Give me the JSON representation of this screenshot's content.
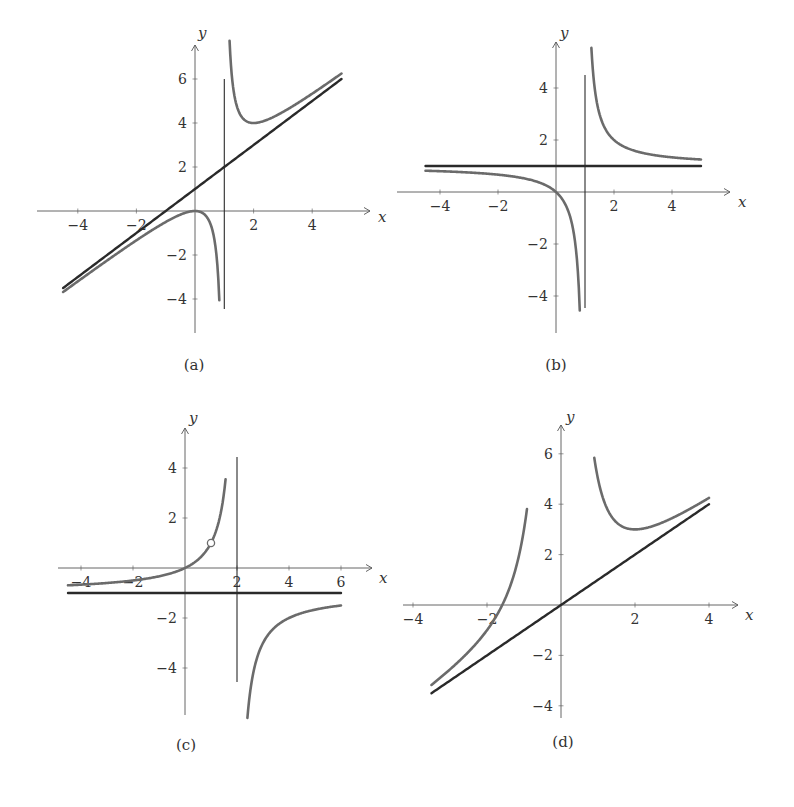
{
  "figure": {
    "captions": [
      "(a)",
      "(b)",
      "(c)",
      "(d)"
    ],
    "colors": {
      "curve": "#6b6b6b",
      "asymptote": "#2a2a2a",
      "axis": "#555555",
      "text": "#333333"
    }
  },
  "chart_data": [
    {
      "type": "line",
      "panel": "(a)",
      "title": "",
      "xlabel": "x",
      "ylabel": "y",
      "xticks": [
        -4,
        -2,
        2,
        4
      ],
      "yticks": [
        -4,
        -2,
        2,
        4,
        6
      ],
      "xlim": [
        -4.5,
        5
      ],
      "ylim": [
        -4.5,
        6
      ],
      "grid": false,
      "series": [
        {
          "name": "f(x) = x^2/(x-1)",
          "role": "curve",
          "formula": "x*x/(x-1)",
          "branches": [
            [
              -4.5,
              0.83
            ],
            [
              1.18,
              5
            ]
          ]
        },
        {
          "name": "y = x + 1",
          "role": "oblique-asymptote",
          "formula": "x+1",
          "branches": [
            [
              -4.5,
              5
            ]
          ]
        },
        {
          "name": "x = 1",
          "role": "vertical-asymptote",
          "x": 1,
          "yrange": [
            -4.5,
            6
          ]
        }
      ],
      "key_points": [
        {
          "x": 0,
          "y": 0,
          "label": "local max"
        },
        {
          "x": 2,
          "y": 4,
          "label": "local min"
        }
      ]
    },
    {
      "type": "line",
      "panel": "(b)",
      "title": "",
      "xlabel": "x",
      "ylabel": "y",
      "xticks": [
        -4,
        -2,
        2,
        4
      ],
      "yticks": [
        -4,
        -2,
        2,
        4
      ],
      "xlim": [
        -4.5,
        5
      ],
      "ylim": [
        -4.5,
        4.5
      ],
      "grid": false,
      "series": [
        {
          "name": "f(x) = x/(x-1)",
          "role": "curve",
          "formula": "x/(x-1)",
          "branches": [
            [
              -4.5,
              0.82
            ],
            [
              1.22,
              5
            ]
          ]
        },
        {
          "name": "y = 1",
          "role": "horizontal-asymptote",
          "formula": "1",
          "branches": [
            [
              -4.5,
              5
            ]
          ]
        },
        {
          "name": "x = 1",
          "role": "vertical-asymptote",
          "x": 1,
          "yrange": [
            -4.5,
            4.5
          ]
        }
      ],
      "key_points": [
        {
          "x": 0,
          "y": 0,
          "label": "intercept"
        }
      ]
    },
    {
      "type": "line",
      "panel": "(c)",
      "title": "",
      "xlabel": "x",
      "ylabel": "y",
      "xticks": [
        -4,
        -2,
        2,
        4,
        6
      ],
      "yticks": [
        -4,
        -2,
        2,
        4
      ],
      "xlim": [
        -4.5,
        6
      ],
      "ylim": [
        -5,
        4.5
      ],
      "grid": false,
      "series": [
        {
          "name": "f(x) = x/(2-x)",
          "role": "curve",
          "formula": "x/(2-x)",
          "branches": [
            [
              -4.5,
              1.56
            ],
            [
              2.4,
              6
            ]
          ]
        },
        {
          "name": "y = -1",
          "role": "horizontal-asymptote",
          "formula": "-1",
          "branches": [
            [
              -4.5,
              6
            ]
          ]
        },
        {
          "name": "x = 2",
          "role": "vertical-asymptote",
          "x": 2,
          "yrange": [
            -4.5,
            4.5
          ]
        }
      ],
      "key_points": [
        {
          "x": 1,
          "y": 1,
          "label": "hole (open circle)"
        },
        {
          "x": 0,
          "y": 0,
          "label": "intercept"
        }
      ]
    },
    {
      "type": "line",
      "panel": "(d)",
      "title": "",
      "xlabel": "x",
      "ylabel": "y",
      "xticks": [
        -4,
        -2,
        2,
        4
      ],
      "yticks": [
        -4,
        -2,
        2,
        4,
        6
      ],
      "xlim": [
        -3.5,
        4
      ],
      "ylim": [
        -4.5,
        6
      ],
      "grid": false,
      "series": [
        {
          "name": "f(x) = x + 4/x^2",
          "role": "curve",
          "formula": "x+4/(x*x)",
          "branches": [
            [
              -3.5,
              -0.92
            ],
            [
              0.9,
              4
            ]
          ]
        },
        {
          "name": "y = x",
          "role": "oblique-asymptote",
          "formula": "x",
          "branches": [
            [
              -3.5,
              4
            ]
          ]
        }
      ],
      "key_points": [
        {
          "x": 2,
          "y": 3,
          "label": "local min"
        },
        {
          "x": -1.59,
          "y": 0,
          "label": "root"
        }
      ]
    }
  ],
  "panels": [
    {
      "origin": [
        195,
        211
      ],
      "sx": 29.3,
      "sy": 22.0,
      "xaxis": [
        37,
        370
      ],
      "yaxis": [
        45,
        333
      ],
      "caption_pos": [
        194,
        370
      ],
      "xlabel_pos": [
        378,
        222
      ],
      "ylabel_pos": [
        198,
        38
      ],
      "vasym_px": [
        79,
        309
      ]
    },
    {
      "origin": [
        556,
        192
      ],
      "sx": 29.0,
      "sy": 26.0,
      "xaxis": [
        397,
        730
      ],
      "yaxis": [
        42,
        333
      ],
      "caption_pos": [
        556,
        370
      ],
      "xlabel_pos": [
        738,
        207
      ],
      "ylabel_pos": [
        560,
        38
      ],
      "vasym_px": [
        75,
        308
      ]
    },
    {
      "origin": [
        185,
        568
      ],
      "sx": 26.0,
      "sy": 25.0,
      "xaxis": [
        58,
        372
      ],
      "yaxis": [
        428,
        715
      ],
      "caption_pos": [
        186,
        750
      ],
      "xlabel_pos": [
        379,
        583
      ],
      "ylabel_pos": [
        189,
        423
      ],
      "vasym_px": [
        457,
        682
      ]
    },
    {
      "origin": [
        561,
        605
      ],
      "sx": 37.0,
      "sy": 25.2,
      "xaxis": [
        403,
        738
      ],
      "yaxis": [
        425,
        718
      ],
      "caption_pos": [
        563,
        747
      ],
      "xlabel_pos": [
        745,
        620
      ],
      "ylabel_pos": [
        566,
        422
      ],
      "vasym_px": null
    }
  ]
}
